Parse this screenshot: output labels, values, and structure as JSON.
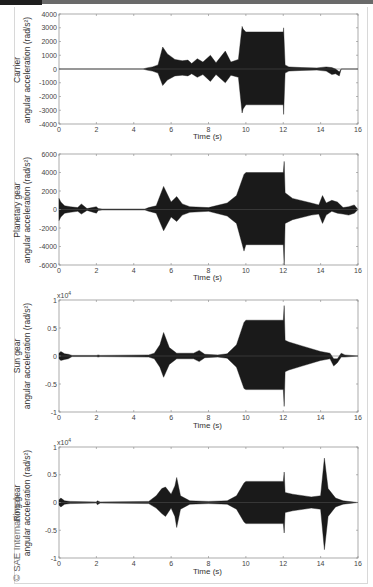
{
  "copyright": "© SAE International",
  "chart_data": [
    {
      "type": "line",
      "title": "",
      "ylabel_line1": "Carrier",
      "ylabel_line2": "angular acceleration (rad/s²)",
      "xlabel": "Time (s)",
      "xlim": [
        0,
        16
      ],
      "ylim": [
        -4000,
        4000
      ],
      "xticks": [
        0,
        2,
        4,
        6,
        8,
        10,
        12,
        14,
        16
      ],
      "yticks": [
        -4000,
        -3000,
        -2000,
        -1000,
        0,
        1000,
        2000,
        3000,
        4000
      ],
      "exponent": "",
      "envelope": {
        "t": [
          0,
          4.5,
          4.7,
          5.0,
          5.3,
          5.55,
          5.8,
          6.2,
          6.6,
          6.9,
          7.1,
          7.4,
          7.7,
          8.1,
          8.4,
          8.9,
          9.2,
          9.6,
          9.8,
          9.85,
          10.0,
          12.0,
          12.02,
          12.1,
          12.3,
          13.0,
          13.8,
          14.3,
          14.6,
          14.8,
          15.0,
          15.1,
          16.0
        ],
        "upper": [
          0,
          0,
          80,
          150,
          300,
          1600,
          1100,
          700,
          600,
          650,
          400,
          750,
          500,
          1000,
          450,
          1300,
          500,
          700,
          3100,
          2900,
          2700,
          2700,
          3000,
          300,
          150,
          100,
          80,
          150,
          100,
          0,
          -200,
          0,
          0
        ],
        "lower": [
          0,
          0,
          -80,
          -150,
          -300,
          -1200,
          -800,
          -500,
          -450,
          -500,
          -350,
          -600,
          -400,
          -900,
          -400,
          -1000,
          -450,
          -600,
          -3200,
          -2900,
          -2600,
          -2600,
          -3300,
          -300,
          -150,
          -100,
          -80,
          -150,
          -400,
          -350,
          -500,
          0,
          0
        ]
      }
    },
    {
      "type": "line",
      "title": "",
      "ylabel_line1": "Planetary gear",
      "ylabel_line2": "angular acceleration (rad/s²)",
      "xlabel": "Time (s)",
      "xlim": [
        0,
        16
      ],
      "ylim": [
        -6000,
        6000
      ],
      "xticks": [
        0,
        2,
        4,
        6,
        8,
        10,
        12,
        14,
        16
      ],
      "yticks": [
        -6000,
        -4000,
        -2000,
        0,
        2000,
        4000,
        6000
      ],
      "exponent": "",
      "envelope": {
        "t": [
          0,
          0.1,
          0.3,
          0.6,
          1.0,
          1.2,
          1.5,
          2.0,
          2.1,
          2.3,
          4.6,
          4.8,
          5.2,
          5.6,
          6.0,
          6.3,
          6.6,
          7.0,
          8.0,
          9.0,
          9.5,
          9.9,
          10.0,
          12.0,
          12.05,
          12.1,
          12.5,
          13.5,
          13.9,
          14.1,
          14.3,
          14.6,
          14.9,
          15.2,
          15.5,
          15.8,
          16.0
        ],
        "upper": [
          1200,
          800,
          400,
          300,
          200,
          600,
          100,
          300,
          100,
          50,
          50,
          200,
          400,
          2500,
          800,
          1400,
          600,
          300,
          200,
          700,
          1500,
          3800,
          4000,
          4000,
          5200,
          1800,
          1200,
          700,
          500,
          1500,
          700,
          1000,
          800,
          200,
          300,
          500,
          0
        ],
        "lower": [
          -1200,
          -800,
          -400,
          -300,
          -200,
          -500,
          -100,
          -400,
          -100,
          -50,
          -50,
          -200,
          -400,
          -2300,
          -800,
          -1300,
          -600,
          -300,
          -200,
          -700,
          -1500,
          -4500,
          -3800,
          -3800,
          -6000,
          -1500,
          -1100,
          -600,
          -500,
          -1500,
          -600,
          -200,
          -400,
          -500,
          -600,
          -400,
          0
        ]
      }
    },
    {
      "type": "line",
      "title": "",
      "ylabel_line1": "Sun gear",
      "ylabel_line2": "angular acceleration (rad/s²)",
      "xlabel": "Time (s)",
      "xlim": [
        0,
        16
      ],
      "ylim": [
        -1,
        1
      ],
      "xticks": [
        0,
        2,
        4,
        6,
        8,
        10,
        12,
        14,
        16
      ],
      "yticks": [
        -1,
        -0.5,
        0,
        0.5,
        1
      ],
      "exponent": "x10^4",
      "envelope": {
        "t": [
          0,
          0.1,
          0.3,
          0.5,
          0.7,
          2.0,
          2.1,
          2.2,
          4.8,
          5.1,
          5.4,
          5.6,
          5.9,
          6.3,
          7.2,
          7.5,
          7.8,
          8.5,
          9.0,
          9.5,
          9.9,
          10.0,
          12.0,
          12.05,
          12.1,
          12.3,
          13.0,
          14.0,
          14.5,
          14.7,
          14.9,
          15.1,
          15.3,
          16.0
        ],
        "upper": [
          0.05,
          0.08,
          0.04,
          0.03,
          0.01,
          0.01,
          0.02,
          0.01,
          0.02,
          0.05,
          0.2,
          0.42,
          0.15,
          0.05,
          0.05,
          0.1,
          0.03,
          0.02,
          0.04,
          0.2,
          0.6,
          0.64,
          0.64,
          0.9,
          0.28,
          0.25,
          0.18,
          0.08,
          0.05,
          -0.05,
          -0.05,
          0.05,
          0.02,
          0.0
        ],
        "lower": [
          -0.05,
          -0.08,
          -0.06,
          -0.05,
          -0.01,
          -0.01,
          -0.02,
          -0.01,
          -0.02,
          -0.05,
          -0.2,
          -0.38,
          -0.15,
          -0.05,
          -0.05,
          -0.1,
          -0.03,
          -0.02,
          -0.04,
          -0.2,
          -0.58,
          -0.6,
          -0.6,
          -0.9,
          -0.28,
          -0.25,
          -0.18,
          -0.08,
          -0.05,
          -0.18,
          -0.12,
          -0.02,
          -0.02,
          0.0
        ]
      }
    },
    {
      "type": "line",
      "title": "",
      "ylabel_line1": "Ring gear",
      "ylabel_line2": "angular acceleration (rad/s²)",
      "xlabel": "Time (s)",
      "xlim": [
        0,
        16
      ],
      "ylim": [
        -1,
        1
      ],
      "xticks": [
        0,
        2,
        4,
        6,
        8,
        10,
        12,
        14,
        16
      ],
      "yticks": [
        -1,
        -0.5,
        0,
        0.5,
        1
      ],
      "exponent": "x10^4",
      "envelope": {
        "t": [
          0,
          0.1,
          0.3,
          0.6,
          2.0,
          2.05,
          2.2,
          4.8,
          5.2,
          5.5,
          5.7,
          6.0,
          6.2,
          6.3,
          6.5,
          7.0,
          8.0,
          9.0,
          9.5,
          9.9,
          10.0,
          12.0,
          12.05,
          12.1,
          12.5,
          13.5,
          14.0,
          14.2,
          14.4,
          14.8,
          15.2,
          16.0
        ],
        "upper": [
          0.05,
          0.08,
          0.03,
          0.02,
          0.01,
          0.03,
          0.01,
          0.02,
          0.12,
          0.25,
          0.28,
          0.15,
          0.3,
          0.45,
          0.12,
          0.03,
          0.02,
          0.03,
          0.12,
          0.35,
          0.38,
          0.38,
          0.55,
          0.18,
          0.15,
          0.1,
          0.12,
          0.8,
          0.25,
          0.08,
          0.03,
          0.0
        ],
        "lower": [
          -0.05,
          -0.08,
          -0.03,
          -0.02,
          -0.01,
          -0.04,
          -0.01,
          -0.02,
          -0.1,
          -0.2,
          -0.25,
          -0.1,
          -0.25,
          -0.45,
          -0.12,
          -0.03,
          -0.02,
          -0.03,
          -0.12,
          -0.35,
          -0.38,
          -0.38,
          -0.55,
          -0.18,
          -0.15,
          -0.1,
          -0.12,
          -0.85,
          -0.25,
          -0.08,
          -0.03,
          0.0
        ]
      }
    }
  ],
  "panels": [
    {
      "ylabel_line1": "Carrier",
      "ylabel_line2": "angular acceleration (rad/s²)",
      "xlabel": "Time (s)",
      "exponent": ""
    },
    {
      "ylabel_line1": "Planetary gear",
      "ylabel_line2": "angular acceleration (rad/s²)",
      "xlabel": "Time (s)",
      "exponent": ""
    },
    {
      "ylabel_line1": "Sun gear",
      "ylabel_line2": "angular acceleration (rad/s²)",
      "xlabel": "Time (s)",
      "exponent": "x10"
    },
    {
      "ylabel_line1": "Ring gear",
      "ylabel_line2": "angular acceleration (rad/s²)",
      "xlabel": "Time (s)",
      "exponent": "x10"
    }
  ],
  "colors": {
    "signal": "#1a1a1a",
    "axis": "#888888",
    "text": "#333333"
  }
}
